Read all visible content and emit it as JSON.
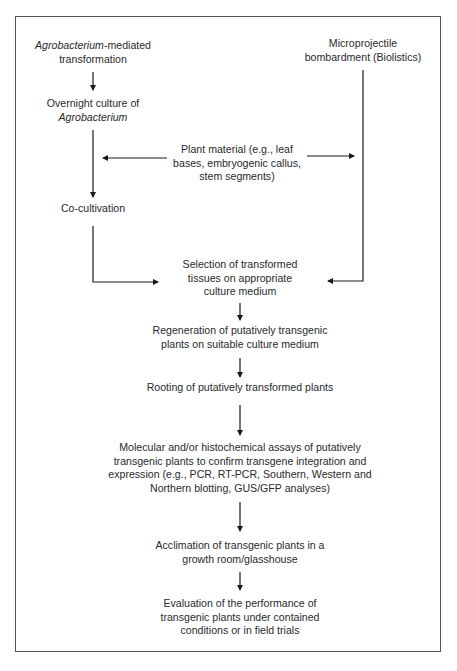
{
  "diagram": {
    "nodes": {
      "agro_mediated": {
        "lines": [
          [
            "Agrobacterium",
            "-mediated"
          ],
          [
            "transformation"
          ]
        ],
        "italic_parts": [
          "Agrobacterium"
        ]
      },
      "agro_mediated_l1_italic": "Agrobacterium",
      "agro_mediated_l1_rest": "-mediated",
      "agro_mediated_l2": "transformation",
      "overnight_l1": "Overnight culture of",
      "overnight_l2_italic": "Agrobacterium",
      "microprojectile_l1": "Microprojectile",
      "microprojectile_l2": "bombardment (Biolistics)",
      "plant_material_l1": "Plant material (e.g., leaf",
      "plant_material_l2": "bases, embryogenic callus,",
      "plant_material_l3": "stem segments)",
      "cocultivation": "Co-cultivation",
      "selection_l1": "Selection of transformed",
      "selection_l2": "tissues on appropriate",
      "selection_l3": "culture medium",
      "regeneration_l1": "Regeneration of putatively transgenic",
      "regeneration_l2": "plants on suitable culture medium",
      "rooting": "Rooting of putatively transformed plants",
      "molecular_l1": "Molecular and/or histochemical assays of putatively",
      "molecular_l2": "transgenic plants to confirm transgene integration and",
      "molecular_l3": "expression (e.g., PCR, RT-PCR, Southern, Western and",
      "molecular_l4": "Northern blotting, GUS/GFP analyses)",
      "acclimation_l1": "Acclimation of transgenic plants in a",
      "acclimation_l2": "growth room/glasshouse",
      "evaluation_l1": "Evaluation of the performance of",
      "evaluation_l2": "transgenic plants under contained",
      "evaluation_l3": "conditions or in field trials"
    },
    "edges": [
      {
        "from": "Agrobacterium-mediated transformation",
        "to": "Overnight culture of Agrobacterium"
      },
      {
        "from": "Overnight culture of Agrobacterium",
        "to": "Co-cultivation"
      },
      {
        "from": "Plant material",
        "to": "Agrobacterium branch"
      },
      {
        "from": "Plant material",
        "to": "Microprojectile bombardment branch"
      },
      {
        "from": "Co-cultivation",
        "to": "Selection of transformed tissues"
      },
      {
        "from": "Microprojectile bombardment (Biolistics)",
        "to": "Selection of transformed tissues"
      },
      {
        "from": "Selection of transformed tissues",
        "to": "Regeneration"
      },
      {
        "from": "Regeneration",
        "to": "Rooting"
      },
      {
        "from": "Rooting",
        "to": "Molecular and/or histochemical assays"
      },
      {
        "from": "Molecular and/or histochemical assays",
        "to": "Acclimation"
      },
      {
        "from": "Acclimation",
        "to": "Evaluation"
      }
    ],
    "colors": {
      "line": "#1a1a1a",
      "border": "#555555",
      "text": "#2a2a2a",
      "background": "#ffffff"
    }
  }
}
